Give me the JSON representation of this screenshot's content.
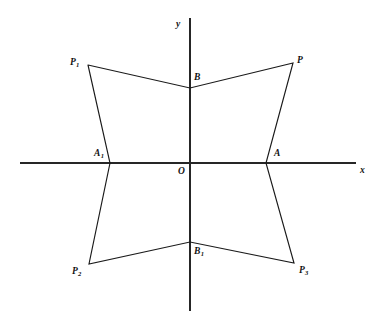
{
  "figure": {
    "kind": "coordinate-geometry-diagram",
    "background_color": "#ffffff",
    "line_color": "#1a1a1a",
    "axis_color": "#262626",
    "width": 379,
    "height": 323
  },
  "axes": {
    "x_axis": {
      "label": "x",
      "label_x": 360,
      "label_y": 166,
      "x1": 20,
      "y1": 163,
      "x2": 356,
      "y2": 163
    },
    "y_axis": {
      "label": "y",
      "label_x": 176,
      "label_y": 20,
      "x1": 190,
      "y1": 18,
      "x2": 190,
      "y2": 311
    },
    "origin": {
      "label": "O",
      "label_x": 178,
      "label_y": 167,
      "x": 190,
      "y": 163
    }
  },
  "points": [
    {
      "id": "P1",
      "label": "P",
      "sub": "1",
      "x": 88,
      "y": 65,
      "label_x": 70,
      "label_y": 58
    },
    {
      "id": "P",
      "label": "P",
      "sub": "",
      "x": 293,
      "y": 63,
      "label_x": 297,
      "label_y": 56
    },
    {
      "id": "B",
      "label": "B",
      "sub": "",
      "x": 190,
      "y": 88,
      "label_x": 194,
      "label_y": 73
    },
    {
      "id": "A1",
      "label": "A",
      "sub": "1",
      "x": 110,
      "y": 163,
      "label_x": 94,
      "label_y": 149
    },
    {
      "id": "A",
      "label": "A",
      "sub": "",
      "x": 266,
      "y": 163,
      "label_x": 274,
      "label_y": 149
    },
    {
      "id": "B1",
      "label": "B",
      "sub": "1",
      "x": 190,
      "y": 242,
      "label_x": 194,
      "label_y": 247
    },
    {
      "id": "P2",
      "label": "P",
      "sub": "2",
      "x": 89,
      "y": 264,
      "label_x": 72,
      "label_y": 267
    },
    {
      "id": "P3",
      "label": "P",
      "sub": "3",
      "x": 294,
      "y": 263,
      "label_x": 299,
      "label_y": 266
    }
  ],
  "polyline_outline": "88,65 190,88 293,63 266,163 294,263 190,242 89,264 110,163 88,65",
  "segments": [
    {
      "name": "P1-B",
      "from": "P1",
      "to": "B"
    },
    {
      "name": "B-P",
      "from": "B",
      "to": "P"
    },
    {
      "name": "P-A",
      "from": "P",
      "to": "A"
    },
    {
      "name": "A-P3",
      "from": "A",
      "to": "P3"
    },
    {
      "name": "P3-B1",
      "from": "P3",
      "to": "B1"
    },
    {
      "name": "B1-P2",
      "from": "B1",
      "to": "P2"
    },
    {
      "name": "P2-A1",
      "from": "P2",
      "to": "A1"
    },
    {
      "name": "A1-P1",
      "from": "A1",
      "to": "P1"
    }
  ]
}
